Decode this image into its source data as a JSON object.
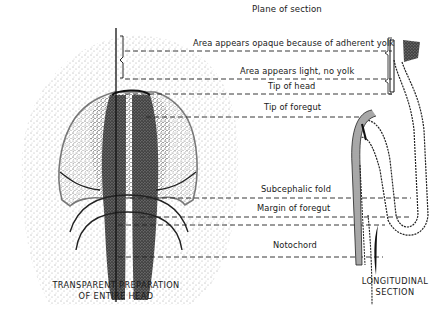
{
  "figure": {
    "plane_label": "Plane of section",
    "labels": [
      {
        "id": "opaque-area",
        "text": "Area appears opaque because of adherent yolk",
        "x": 193,
        "y": 40
      },
      {
        "id": "light-area",
        "text": "Area appears light, no yolk",
        "x": 240,
        "y": 68
      },
      {
        "id": "tip-head",
        "text": "Tip of head",
        "x": 268,
        "y": 82
      },
      {
        "id": "tip-foregut",
        "text": "Tip of foregut",
        "x": 264,
        "y": 103
      },
      {
        "id": "subcephalic-fold",
        "text": "Subcephalic fold",
        "x": 261,
        "y": 183
      },
      {
        "id": "margin-foregut",
        "text": "Margin of foregut",
        "x": 257,
        "y": 202
      },
      {
        "id": "notochord",
        "text": "Notochord",
        "x": 273,
        "y": 234
      }
    ],
    "captions": {
      "left_line1": "TRANSPARENT PREPARATION",
      "left_line2": "OF ENTIRE HEAD",
      "right_line1": "LONGITUDINAL",
      "right_line2": "SECTION"
    },
    "ink_color": "#1a1a1a"
  }
}
